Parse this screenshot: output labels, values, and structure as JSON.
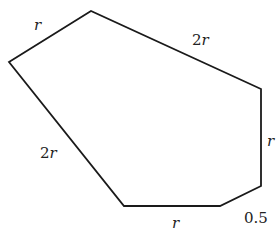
{
  "diagram": {
    "type": "polygon",
    "stroke_color": "#1a1a1a",
    "background": "#ffffff",
    "vertices": [
      {
        "x": 9,
        "y": 62
      },
      {
        "x": 91,
        "y": 11
      },
      {
        "x": 261,
        "y": 89
      },
      {
        "x": 261,
        "y": 186
      },
      {
        "x": 220,
        "y": 206
      },
      {
        "x": 124,
        "y": 206
      }
    ],
    "edge_labels": [
      {
        "id": "top-left",
        "coef": "",
        "var": "r",
        "x": 34,
        "y": 30
      },
      {
        "id": "top-right",
        "coef": "2",
        "var": "r",
        "x": 192,
        "y": 45
      },
      {
        "id": "right",
        "coef": "",
        "var": "r",
        "x": 267,
        "y": 146
      },
      {
        "id": "bottom-right-short",
        "coef": "0.5",
        "var": "",
        "x": 244,
        "y": 223
      },
      {
        "id": "bottom",
        "coef": "",
        "var": "r",
        "x": 172,
        "y": 228
      },
      {
        "id": "left",
        "coef": "2",
        "var": "r",
        "x": 40,
        "y": 158
      }
    ]
  }
}
